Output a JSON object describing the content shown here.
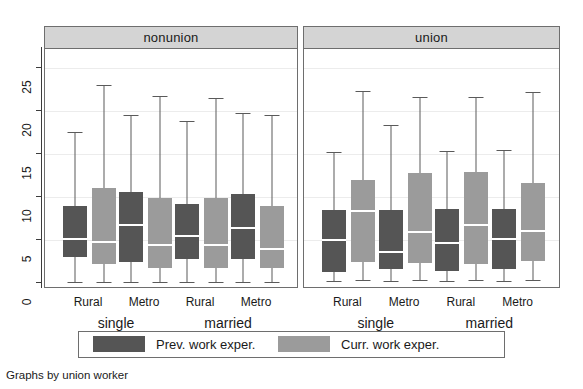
{
  "chart_data": {
    "type": "box",
    "title": "",
    "caption": "Graphs by union worker",
    "ylabel": "",
    "xlabel": "",
    "ylim": [
      0,
      27
    ],
    "yticks": [
      0,
      5,
      10,
      15,
      20,
      25
    ],
    "grid": true,
    "legend": {
      "position": "bottom",
      "entries": [
        {
          "name": "Prev. work exper.",
          "color": "#555555"
        },
        {
          "name": "Curr. work exper.",
          "color": "#9b9b9b"
        }
      ]
    },
    "panels": [
      {
        "label": "nonunion",
        "groups": [
          {
            "label": "single",
            "categories": [
              "Rural",
              "Metro"
            ],
            "boxes": [
              {
                "category": "Rural",
                "series": "Prev. work exper.",
                "lower_whisker": 0.1,
                "q1": 3.0,
                "median": 5.1,
                "q3": 9.0,
                "upper_whisker": 17.6
              },
              {
                "category": "Rural",
                "series": "Curr. work exper.",
                "lower_whisker": 0.1,
                "q1": 2.2,
                "median": 4.8,
                "q3": 11.1,
                "upper_whisker": 23.1
              },
              {
                "category": "Metro",
                "series": "Prev. work exper.",
                "lower_whisker": 0.1,
                "q1": 2.5,
                "median": 6.7,
                "q3": 10.6,
                "upper_whisker": 19.5
              },
              {
                "category": "Metro",
                "series": "Curr. work exper.",
                "lower_whisker": 0.1,
                "q1": 1.8,
                "median": 4.4,
                "q3": 9.9,
                "upper_whisker": 21.8
              }
            ]
          },
          {
            "label": "married",
            "categories": [
              "Rural",
              "Metro"
            ],
            "boxes": [
              {
                "category": "Rural",
                "series": "Prev. work exper.",
                "lower_whisker": 0.1,
                "q1": 2.8,
                "median": 5.5,
                "q3": 9.2,
                "upper_whisker": 18.8
              },
              {
                "category": "Rural",
                "series": "Curr. work exper.",
                "lower_whisker": 0.1,
                "q1": 1.8,
                "median": 4.4,
                "q3": 9.9,
                "upper_whisker": 21.5
              },
              {
                "category": "Metro",
                "series": "Prev. work exper.",
                "lower_whisker": 0.1,
                "q1": 2.8,
                "median": 6.4,
                "q3": 10.4,
                "upper_whisker": 19.8
              },
              {
                "category": "Metro",
                "series": "Curr. work exper.",
                "lower_whisker": 0.1,
                "q1": 1.7,
                "median": 3.9,
                "q3": 9.0,
                "upper_whisker": 19.5
              }
            ]
          }
        ]
      },
      {
        "label": "union",
        "groups": [
          {
            "label": "single",
            "categories": [
              "Rural",
              "Metro"
            ],
            "boxes": [
              {
                "category": "Rural",
                "series": "Prev. work exper.",
                "lower_whisker": 0.2,
                "q1": 1.3,
                "median": 5.0,
                "q3": 8.5,
                "upper_whisker": 15.2
              },
              {
                "category": "Rural",
                "series": "Curr. work exper.",
                "lower_whisker": 0.3,
                "q1": 2.4,
                "median": 8.4,
                "q3": 12.0,
                "upper_whisker": 22.3
              },
              {
                "category": "Metro",
                "series": "Prev. work exper.",
                "lower_whisker": 0.2,
                "q1": 1.6,
                "median": 3.6,
                "q3": 8.5,
                "upper_whisker": 18.4
              },
              {
                "category": "Metro",
                "series": "Curr. work exper.",
                "lower_whisker": 0.3,
                "q1": 2.3,
                "median": 5.9,
                "q3": 12.8,
                "upper_whisker": 21.6
              }
            ]
          },
          {
            "label": "married",
            "categories": [
              "Rural",
              "Metro"
            ],
            "boxes": [
              {
                "category": "Rural",
                "series": "Prev. work exper.",
                "lower_whisker": 0.2,
                "q1": 1.4,
                "median": 4.6,
                "q3": 8.6,
                "upper_whisker": 15.4
              },
              {
                "category": "Rural",
                "series": "Curr. work exper.",
                "lower_whisker": 0.3,
                "q1": 2.2,
                "median": 6.8,
                "q3": 12.9,
                "upper_whisker": 21.7
              },
              {
                "category": "Metro",
                "series": "Prev. work exper.",
                "lower_whisker": 0.2,
                "q1": 1.6,
                "median": 5.1,
                "q3": 8.6,
                "upper_whisker": 15.5
              },
              {
                "category": "Metro",
                "series": "Curr. work exper.",
                "lower_whisker": 0.3,
                "q1": 2.6,
                "median": 6.1,
                "q3": 11.6,
                "upper_whisker": 22.2
              }
            ]
          }
        ]
      }
    ]
  },
  "colors": {
    "prev": "#555555",
    "curr": "#9b9b9b",
    "panel_header_bg": "#d4d4d4",
    "border": "#6e6e6e",
    "grid": "#ececec",
    "median": "#ffffff",
    "whisker": "#5a5a5a",
    "text": "#1a1a1a"
  }
}
